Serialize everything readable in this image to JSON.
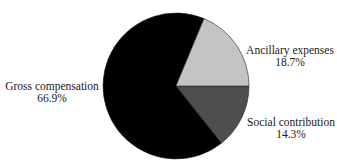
{
  "chart_data": {
    "type": "pie",
    "title": "",
    "categories": [
      "Gross compensation",
      "Ancillary expenses",
      "Social contribution"
    ],
    "values": [
      66.9,
      18.7,
      14.3
    ],
    "value_labels": [
      "66.9%",
      "18.7%",
      "14.3%"
    ],
    "colors": [
      "#000000",
      "#c4c4c4",
      "#4e4e4e"
    ],
    "legend": "none (direct slice labels)",
    "start_angle_deg": 0,
    "direction": "ccw for Ancillary expenses above, cw for Social contribution below"
  },
  "labels": {
    "gross": {
      "name": "Gross compensation",
      "value": "66.9%"
    },
    "ancillary": {
      "name": "Ancillary expenses",
      "value": "18.7%"
    },
    "social": {
      "name": "Social contribution",
      "value": "14.3%"
    }
  }
}
